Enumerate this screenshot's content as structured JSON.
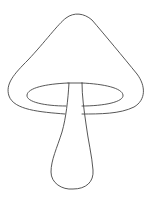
{
  "image": {
    "subject": "mushroom-outline",
    "background": "#ffffff",
    "stroke_color": "#444444"
  }
}
